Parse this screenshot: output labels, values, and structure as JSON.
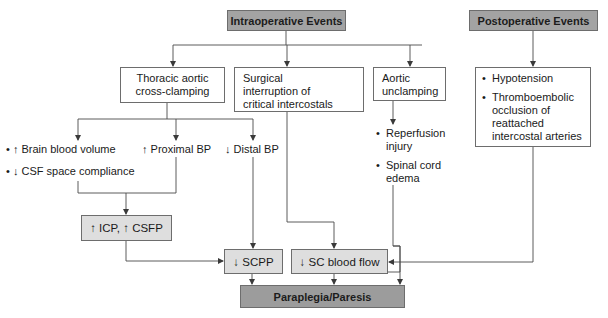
{
  "headers": {
    "intraoperative": "Intraoperative Events",
    "postoperative": "Postoperative Events"
  },
  "intraoperative_events": [
    {
      "id": "thoracic",
      "label_lines": [
        "Thoracic aortic",
        "cross-clamping"
      ]
    },
    {
      "id": "surgical",
      "label_lines": [
        "Surgical",
        "interruption of",
        "critical intercostals"
      ]
    },
    {
      "id": "aortic",
      "label_lines": [
        "Aortic",
        "unclamping"
      ]
    }
  ],
  "postoperative_items": [
    {
      "bullet": "•",
      "lines": [
        "Hypotension"
      ]
    },
    {
      "bullet": "•",
      "lines": [
        "Thromboembolic",
        "occlusion of",
        "reattached",
        "intercostal arteries"
      ]
    }
  ],
  "clamping_effects": {
    "brain_blood_volume": "• ↑ Brain blood volume",
    "csf_compliance": "• ↓ CSF space compliance",
    "proximal_bp": "↑ Proximal BP",
    "distal_bp": "↓ Distal BP"
  },
  "unclamping_effects": [
    {
      "bullet": "•",
      "lines": [
        "Reperfusion",
        "injury"
      ]
    },
    {
      "bullet": "•",
      "lines": [
        "Spinal cord",
        "edema"
      ]
    }
  ],
  "intermediate": {
    "icp_csfp": "↑ ICP, ↑ CSFP",
    "scpp": "↓ SCPP",
    "sc_blood_flow": "↓ SC blood flow"
  },
  "outcome": "Paraplegia/Paresis",
  "colors": {
    "header_fill": "#a3a3a3",
    "intermediate_fill": "#dedede",
    "line": "#4a4a4a"
  }
}
